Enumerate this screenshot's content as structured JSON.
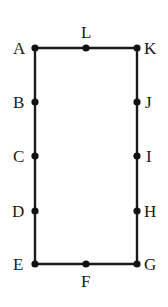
{
  "figure": {
    "background_color": "#FFFFFF",
    "stroke_color": "#1A1A1A",
    "dot_color": "#111111",
    "stroke_width": 2.4,
    "dot_radius": 3.6,
    "rectangle": {
      "left": 35,
      "top": 48,
      "right": 137,
      "bottom": 264,
      "width": 102,
      "height": 216
    },
    "points": [
      {
        "label": "A",
        "x": 35,
        "y": 48,
        "side": "top-left-corner",
        "label_x": 13,
        "label_y": 40
      },
      {
        "label": "B",
        "x": 35,
        "y": 102,
        "side": "left",
        "label_x": 13,
        "label_y": 94
      },
      {
        "label": "C",
        "x": 35,
        "y": 156,
        "side": "left",
        "label_x": 13,
        "label_y": 148
      },
      {
        "label": "D",
        "x": 35,
        "y": 211,
        "side": "left",
        "label_x": 12,
        "label_y": 203
      },
      {
        "label": "E",
        "x": 35,
        "y": 264,
        "side": "bottom-left-corner",
        "label_x": 13,
        "label_y": 256
      },
      {
        "label": "F",
        "x": 86,
        "y": 264,
        "side": "bottom",
        "label_x": 81,
        "label_y": 273
      },
      {
        "label": "G",
        "x": 137,
        "y": 264,
        "side": "bottom-right-corner",
        "label_x": 144,
        "label_y": 256
      },
      {
        "label": "H",
        "x": 137,
        "y": 211,
        "side": "right",
        "label_x": 144,
        "label_y": 203
      },
      {
        "label": "I",
        "x": 137,
        "y": 156,
        "side": "right",
        "label_x": 146,
        "label_y": 148
      },
      {
        "label": "J",
        "x": 137,
        "y": 102,
        "side": "right",
        "label_x": 145,
        "label_y": 94
      },
      {
        "label": "K",
        "x": 137,
        "y": 48,
        "side": "top-right-corner",
        "label_x": 144,
        "label_y": 40
      },
      {
        "label": "L",
        "x": 86,
        "y": 48,
        "side": "top",
        "label_x": 81,
        "label_y": 24
      }
    ],
    "edges": [
      {
        "name": "top-edge",
        "x1": 35,
        "y1": 48,
        "x2": 137,
        "y2": 48
      },
      {
        "name": "right-edge",
        "x1": 137,
        "y1": 48,
        "x2": 137,
        "y2": 264
      },
      {
        "name": "bottom-edge",
        "x1": 137,
        "y1": 264,
        "x2": 35,
        "y2": 264
      },
      {
        "name": "left-edge",
        "x1": 35,
        "y1": 264,
        "x2": 35,
        "y2": 48
      }
    ]
  }
}
